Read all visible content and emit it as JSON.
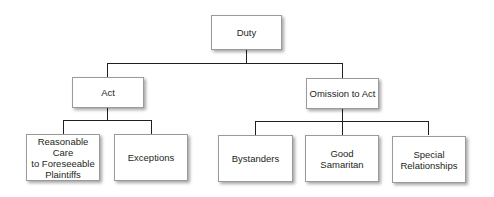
{
  "diagram": {
    "type": "tree",
    "root": {
      "label": "Duty",
      "children": [
        {
          "label": "Act",
          "children": [
            {
              "label": "Reasonable Care\nto Foreseeable\nPlaintiffs"
            },
            {
              "label": "Exceptions"
            }
          ]
        },
        {
          "label": "Omission to Act",
          "children": [
            {
              "label": "Bystanders"
            },
            {
              "label": "Good\nSamaritan"
            },
            {
              "label": "Special\nRelationships"
            }
          ]
        }
      ]
    }
  },
  "colors": {
    "line": "#231f20",
    "box_fill": "#ffffff",
    "box_border": "#9a9a9a",
    "text": "#231f20"
  }
}
